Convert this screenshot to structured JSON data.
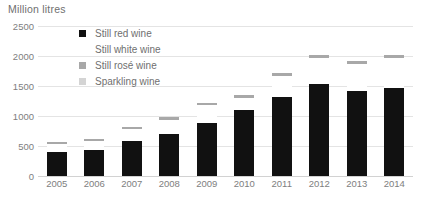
{
  "chart_data": {
    "type": "bar",
    "subtype": "stacked-column",
    "title": "",
    "ylabel": "Million litres",
    "xlabel": "",
    "ylim": [
      0,
      2500
    ],
    "yticks": [
      2500,
      2000,
      1500,
      1000,
      500,
      0
    ],
    "grid": true,
    "legend_position": "inside-top-left",
    "categories": [
      "2005",
      "2006",
      "2007",
      "2008",
      "2009",
      "2010",
      "2011",
      "2012",
      "2013",
      "2014"
    ],
    "series": [
      {
        "name": "Still red wine",
        "color": "#111111",
        "values": [
          400,
          430,
          580,
          700,
          880,
          1100,
          1320,
          1540,
          1420,
          1460
        ]
      },
      {
        "name": "Still white wine",
        "color": "#ffffff",
        "values": [
          135,
          155,
          205,
          240,
          300,
          200,
          340,
          420,
          440,
          500
        ]
      },
      {
        "name": "Still rosé wine",
        "color": "#a8a8a8",
        "values": [
          25,
          30,
          35,
          40,
          45,
          50,
          55,
          60,
          60,
          60
        ]
      },
      {
        "name": "Sparkling wine",
        "color": "#d0d0d0",
        "values": [
          0,
          0,
          0,
          0,
          0,
          0,
          0,
          0,
          0,
          0
        ]
      }
    ],
    "totals": [
      560,
      615,
      820,
      980,
      1225,
      1350,
      1715,
      2020,
      1920,
      2020
    ]
  },
  "legend": {
    "items": [
      {
        "label": "Still red wine",
        "swatch_class": "sw-red",
        "icon": "square-marker-black"
      },
      {
        "label": "Still white wine",
        "swatch_class": "sw-white",
        "icon": "square-marker-white"
      },
      {
        "label": "Still rosé wine",
        "swatch_class": "sw-rose",
        "icon": "square-marker-gray"
      },
      {
        "label": "Sparkling wine",
        "swatch_class": "sw-spark",
        "icon": "square-marker-light-gray"
      }
    ]
  },
  "colors": {
    "gridline": "#e4e4e4",
    "baseline": "#d2d2d2",
    "text": "#7a7a7a",
    "background": "#ffffff"
  }
}
